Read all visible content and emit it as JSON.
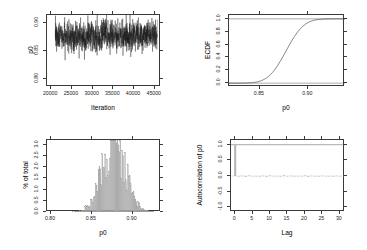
{
  "figure": {
    "title": "",
    "background": "#ffffff",
    "layout": "2x2 grid of MCMC diagnostic panels",
    "parameter": "p0"
  },
  "chart_data": [
    {
      "id": "trace",
      "type": "line",
      "title": "",
      "xlabel": "Iteration",
      "ylabel": "p0",
      "xlim": [
        19000,
        46500
      ],
      "ylim": [
        0.785,
        0.915
      ],
      "xticks": [
        20000,
        25000,
        30000,
        35000,
        40000,
        45000
      ],
      "xticklabels": [
        "20000",
        "25000",
        "30000",
        "35000",
        "40000",
        "45000"
      ],
      "yticks": [
        0.8,
        0.85,
        0.9
      ],
      "yticklabels": [
        "0.80",
        "0.85",
        "0.90"
      ],
      "grid": false,
      "legend": null,
      "series": [
        {
          "name": "p0 trace",
          "color": "#1a1a1a",
          "description": "Dense MCMC trace oscillating about 0.877 between iterations 21000 and 45500",
          "center": 0.877,
          "sd": 0.0145,
          "x_start": 21000,
          "x_end": 45600,
          "n_points": 1200
        }
      ]
    },
    {
      "id": "ecdf",
      "type": "line",
      "title": "",
      "xlabel": "p0",
      "ylabel": "ECDF",
      "xlim": [
        0.818,
        0.938
      ],
      "ylim": [
        -0.06,
        1.06
      ],
      "xticks": [
        0.85,
        0.9
      ],
      "xticklabels": [
        "0.85",
        "0.90"
      ],
      "yticks": [
        0.0,
        0.2,
        0.4,
        0.6,
        0.8,
        1.0
      ],
      "yticklabels": [
        "0.0",
        "0.2",
        "0.4",
        "0.6",
        "0.8",
        "1.0"
      ],
      "grid": false,
      "legend": null,
      "series": [
        {
          "name": "ECDF of p0",
          "color": "#2a2a2a",
          "description": "Sigmoid cumulative distribution rising from 0 near 0.825 to 1 near 0.925",
          "center": 0.877,
          "sd": 0.0145,
          "reference_lines": [
            0.0,
            1.0
          ]
        }
      ]
    },
    {
      "id": "histogram",
      "type": "bar",
      "title": "",
      "xlabel": "p0",
      "ylabel": "% of total",
      "xlim": [
        0.795,
        0.935
      ],
      "ylim": [
        0,
        3.2
      ],
      "xticks": [
        0.8,
        0.85,
        0.9
      ],
      "xticklabels": [
        "0.80",
        "0.85",
        "0.90"
      ],
      "yticks": [
        0.0,
        0.5,
        1.0,
        1.5,
        2.0,
        2.5,
        3.0
      ],
      "yticklabels": [
        "0.0",
        "0.5",
        "1.0",
        "1.5",
        "2.0",
        "2.5",
        "3.0"
      ],
      "grid": false,
      "legend": null,
      "bar_color": "#b0b0b0",
      "bin_count": 110,
      "series": [
        {
          "name": "% of total",
          "center": 0.877,
          "sd": 0.0145,
          "peak_value": 3.05,
          "description": "Ragged bell-shaped histogram peaking near 0.877 at about 3.0 percent"
        }
      ]
    },
    {
      "id": "acf",
      "type": "bar",
      "title": "",
      "xlabel": "Lag",
      "ylabel": "Autocorrelation of p0",
      "xlim": [
        -1.2,
        31.5
      ],
      "ylim": [
        -1.15,
        1.15
      ],
      "xticks": [
        0,
        5,
        10,
        15,
        20,
        25,
        30
      ],
      "xticklabels": [
        "0",
        "5",
        "10",
        "15",
        "20",
        "25",
        "30"
      ],
      "yticks": [
        -1.0,
        -0.5,
        0.0,
        0.5,
        1.0
      ],
      "yticklabels": [
        "-1.0",
        "-0.5",
        "0.0",
        "0.5",
        "1.0"
      ],
      "grid": false,
      "legend": null,
      "bar_color": "#b4b4b4",
      "lags": [
        0,
        1,
        2,
        3,
        4,
        5,
        6,
        7,
        8,
        9,
        10,
        11,
        12,
        13,
        14,
        15,
        16,
        17,
        18,
        19,
        20,
        21,
        22,
        23,
        24,
        25,
        26,
        27,
        28,
        29,
        30
      ],
      "values": [
        1.0,
        -0.02,
        0.01,
        -0.03,
        0.02,
        -0.01,
        0.0,
        -0.02,
        0.01,
        -0.03,
        0.02,
        -0.01,
        0.0,
        -0.02,
        0.03,
        -0.01,
        0.01,
        -0.02,
        0.0,
        -0.01,
        0.02,
        -0.03,
        0.01,
        0.0,
        -0.02,
        0.01,
        -0.01,
        0.0,
        -0.02,
        0.01,
        -0.01
      ],
      "description": "Spike of 1.0 at lag 0, all other lags essentially zero"
    }
  ],
  "panels": {
    "trace": {
      "name": "trace-plot",
      "ylabel": "p0",
      "xlabel": "Iteration",
      "yticklabels": [
        "0.90",
        "0.85",
        "0.80"
      ],
      "xticklabels": [
        "20000",
        "25000",
        "30000",
        "35000",
        "40000",
        "45000"
      ]
    },
    "ecdf": {
      "name": "ecdf-plot",
      "ylabel": "ECDF",
      "xlabel": "p0",
      "yticklabels": [
        "1.0",
        "0.8",
        "0.6",
        "0.4",
        "0.2",
        "0.0"
      ],
      "xticklabels": [
        "0.85",
        "0.90"
      ]
    },
    "histogram": {
      "name": "histogram-plot",
      "ylabel": "% of total",
      "xlabel": "p0",
      "yticklabels": [
        "3.0",
        "2.5",
        "2.0",
        "1.5",
        "1.0",
        "0.5",
        "0.0"
      ],
      "xticklabels": [
        "0.80",
        "0.85",
        "0.90"
      ]
    },
    "acf": {
      "name": "autocorrelation-plot",
      "ylabel": "Autocorrelation of p0",
      "xlabel": "Lag",
      "yticklabels": [
        "1.0",
        "0.5",
        "0.0",
        "-0.5",
        "-1.0"
      ],
      "xticklabels": [
        "0",
        "5",
        "10",
        "15",
        "20",
        "25",
        "30"
      ]
    }
  }
}
